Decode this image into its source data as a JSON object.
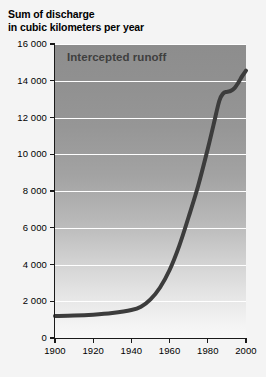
{
  "chart_data": {
    "type": "line",
    "title": "Sum of discharge in cubic kilometers per year",
    "title_lines": [
      "Sum of discharge",
      "in cubic kilometers per year"
    ],
    "xlabel": "",
    "ylabel": "",
    "xlim": [
      1900,
      2000
    ],
    "ylim": [
      0,
      16000
    ],
    "grid": true,
    "grid_axis": "y",
    "legend": "none",
    "annotations": [
      {
        "text": "Intercepted runoff",
        "x": 1906,
        "y": 15300
      }
    ],
    "x_ticks": [
      1900,
      1920,
      1940,
      1960,
      1980,
      2000
    ],
    "x_tick_labels": [
      "1900",
      "1920",
      "1940",
      "1960",
      "1980",
      "2000"
    ],
    "y_ticks": [
      0,
      2000,
      4000,
      6000,
      8000,
      10000,
      12000,
      14000,
      16000
    ],
    "y_tick_labels": [
      "0",
      "2 000",
      "4 000",
      "6 000",
      "8 000",
      "10 000",
      "12 000",
      "14 000",
      "16 000"
    ],
    "series": [
      {
        "name": "Intercepted runoff",
        "color": "#3c3c3c",
        "line_width": 4,
        "x": [
          1900,
          1910,
          1920,
          1930,
          1940,
          1945,
          1950,
          1955,
          1960,
          1965,
          1970,
          1975,
          1980,
          1983,
          1986,
          1988,
          1990,
          1992,
          1994,
          1996,
          1998,
          2000
        ],
        "values": [
          1200,
          1220,
          1270,
          1360,
          1520,
          1700,
          2100,
          2750,
          3700,
          5000,
          6600,
          8300,
          10300,
          11600,
          12900,
          13300,
          13400,
          13450,
          13600,
          13900,
          14250,
          14550
        ]
      }
    ],
    "colors": {
      "plot_top": "#8d8d8d",
      "plot_bottom": "#f8f8f8",
      "gridline": "#ffffff",
      "axis": "#1a1a1a",
      "curve": "#3c3c3c",
      "annotation_text": "#3f3f3f",
      "title_text": "#000000",
      "page_background": "#f4f4f4"
    }
  }
}
